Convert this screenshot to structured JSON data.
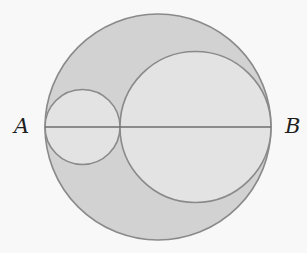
{
  "figure": {
    "type": "geometry",
    "colors": {
      "background": "#f8f8f8",
      "shaded_region": "#d2d2d2",
      "inner_circle_fill": "#e3e3e3",
      "stroke": "#8a8a8a",
      "label": "#1e1e1e"
    },
    "points": [
      {
        "label": "A",
        "x": 45,
        "y": 127
      },
      {
        "label": "B",
        "x": 271,
        "y": 127
      }
    ],
    "circles": [
      {
        "name": "large-circle",
        "cx": 158,
        "cy": 127,
        "r": 113,
        "shaded": true
      },
      {
        "name": "small-circle",
        "cx": 82.5,
        "cy": 127,
        "r": 37.5,
        "shaded": false
      },
      {
        "name": "medium-circle",
        "cx": 195.5,
        "cy": 127,
        "r": 75.5,
        "shaded": false
      }
    ],
    "segments": [
      {
        "name": "diameter-AB",
        "from": "A",
        "to": "B"
      }
    ]
  },
  "labels": {
    "a": "A",
    "b": "B"
  }
}
